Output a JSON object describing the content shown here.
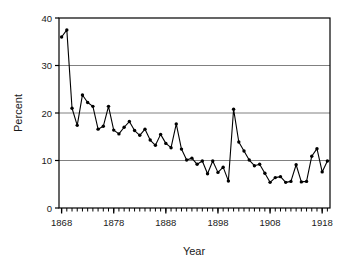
{
  "chart_data": {
    "type": "line",
    "title": "",
    "xlabel": "Year",
    "ylabel": "Percent",
    "xlim": [
      1867.5,
      1919.5
    ],
    "ylim": [
      0,
      40
    ],
    "yticks": [
      0,
      10,
      20,
      30,
      40
    ],
    "ytick_labels": [
      "0",
      "10",
      "20",
      "30",
      "40"
    ],
    "xticks": [
      1868,
      1878,
      1888,
      1898,
      1908,
      1918
    ],
    "xtick_labels": [
      "1868",
      "1878",
      "1888",
      "1898",
      "1908",
      "1918"
    ],
    "minor_xtick_interval": 1,
    "grid": "horizontal-major-only",
    "grid_color": "#808080",
    "frame": true,
    "frame_color": "#000000",
    "legend": "none",
    "marker": "filled-circle",
    "line_color": "#000000",
    "marker_color": "#000000",
    "x": [
      1868,
      1869,
      1870,
      1871,
      1872,
      1873,
      1874,
      1875,
      1876,
      1877,
      1878,
      1879,
      1880,
      1881,
      1882,
      1883,
      1884,
      1885,
      1886,
      1887,
      1888,
      1889,
      1890,
      1891,
      1892,
      1893,
      1894,
      1895,
      1896,
      1897,
      1898,
      1899,
      1900,
      1901,
      1902,
      1903,
      1904,
      1905,
      1906,
      1907,
      1908,
      1909,
      1910,
      1911,
      1912,
      1913,
      1914,
      1915,
      1916,
      1917,
      1918,
      1919
    ],
    "values": [
      36.0,
      37.5,
      21.0,
      17.4,
      23.8,
      22.2,
      21.4,
      16.6,
      17.2,
      21.4,
      16.4,
      15.6,
      17.0,
      18.2,
      16.3,
      15.3,
      16.6,
      14.3,
      13.2,
      15.5,
      13.6,
      12.7,
      17.7,
      12.4,
      10.1,
      10.5,
      9.2,
      9.9,
      7.2,
      9.9,
      7.5,
      8.6,
      5.7,
      20.8,
      13.9,
      12.0,
      10.1,
      8.9,
      9.2,
      7.3,
      5.4,
      6.4,
      6.6,
      5.4,
      5.6,
      9.1,
      5.5,
      5.6,
      10.9,
      12.5,
      7.6,
      9.9
    ],
    "series": [
      {
        "name": "percent",
        "values": [
          36.0,
          37.5,
          21.0,
          17.4,
          23.8,
          22.2,
          21.4,
          16.6,
          17.2,
          21.4,
          16.4,
          15.6,
          17.0,
          18.2,
          16.3,
          15.3,
          16.6,
          14.3,
          13.2,
          15.5,
          13.6,
          12.7,
          17.7,
          12.4,
          10.1,
          10.5,
          9.2,
          9.9,
          7.2,
          9.9,
          7.5,
          8.6,
          5.7,
          20.8,
          13.9,
          12.0,
          10.1,
          8.9,
          9.2,
          7.3,
          5.4,
          6.4,
          6.6,
          5.4,
          5.6,
          9.1,
          5.5,
          5.6,
          10.9,
          12.5,
          7.6,
          9.9
        ]
      }
    ]
  }
}
